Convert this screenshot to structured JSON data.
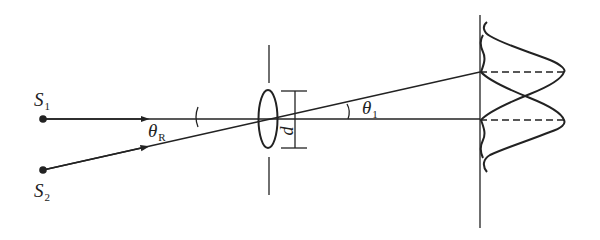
{
  "diagram": {
    "colors": {
      "line": "#222222",
      "background": "#ffffff"
    },
    "sources": [
      {
        "id": "S1",
        "symbol": "S",
        "subscript": "1",
        "x": 43,
        "y": 119
      },
      {
        "id": "S2",
        "symbol": "S",
        "subscript": "2",
        "x": 43,
        "y": 170
      }
    ],
    "angles": [
      {
        "id": "theta-R",
        "symbol": "θ",
        "subscript": "R"
      },
      {
        "id": "theta-1",
        "symbol": "θ",
        "subscript": "1"
      }
    ],
    "aperture": {
      "label": "d"
    },
    "screen": {
      "patterns": [
        "diffraction pattern of S1",
        "diffraction pattern of S2"
      ]
    }
  }
}
